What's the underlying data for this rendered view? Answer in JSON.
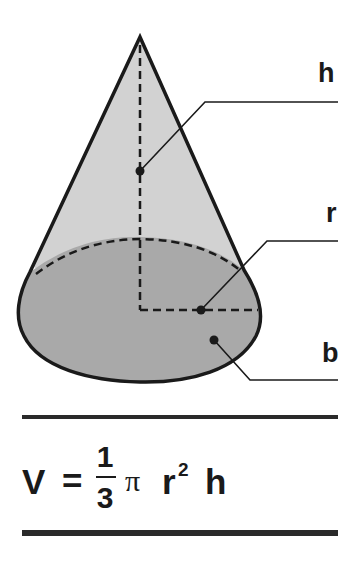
{
  "figure": {
    "colors": {
      "stroke": "#1a1a1a",
      "lateral_fill": "#d2d2d2",
      "base_fill": "#a9a9a9",
      "background": "#ffffff"
    },
    "labels": {
      "height": "h",
      "radius": "r",
      "base": "b"
    }
  },
  "formula": {
    "lhs": "V",
    "equals": "=",
    "numerator": "1",
    "denominator": "3",
    "pi": "π",
    "radius": "r",
    "exponent": "2",
    "height": "h",
    "text": "V = 1/3 π r² h"
  }
}
